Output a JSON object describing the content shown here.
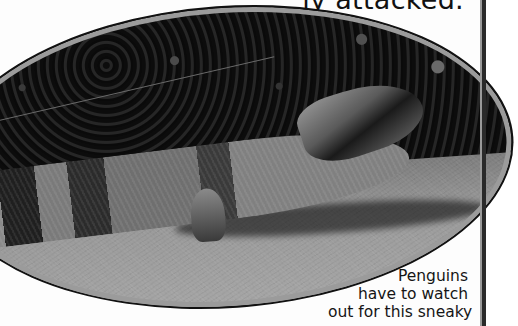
{
  "page": {
    "top_text": "ly attacked.",
    "caption_lines": [
      "Penguins",
      "have to watch",
      "out for this sneaky"
    ]
  },
  "photo": {
    "subject": "blue-tongued lizard on sandy ground",
    "shape": "ellipse",
    "border_color": "#9b9b9b"
  },
  "colors": {
    "background": "#fdfdfd",
    "text": "#111111",
    "rule": "#2a2a2a"
  }
}
